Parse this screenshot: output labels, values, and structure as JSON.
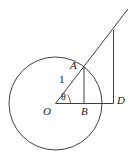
{
  "figure": {
    "kind": "geometry-diagram",
    "background_color": "#ffffff",
    "stroke_color": "#2b2b2b",
    "labels": {
      "point_A": "A",
      "point_O": "O",
      "point_B": "B",
      "point_D": "D",
      "radius_length": "1",
      "angle": "θ"
    },
    "points": {
      "O": {
        "x": 55.5,
        "y": 103.5,
        "name": "center"
      },
      "A": {
        "x": 84.0,
        "y": 67.0,
        "name": "point-on-circle"
      },
      "B": {
        "x": 84.0,
        "y": 103.5,
        "name": "foot-of-perpendicular"
      },
      "D": {
        "x": 113.5,
        "y": 103.5,
        "name": "point-on-axis"
      },
      "T": {
        "x": 113.5,
        "y": 30.0,
        "name": "top-of-vertical-segment"
      },
      "ray_end": {
        "x": 128.0,
        "y": 9.0,
        "name": "ray-terminus"
      }
    },
    "circle": {
      "cx": 55.5,
      "cy": 103.5,
      "r": 46.5,
      "radius_label": "1"
    },
    "segments": [
      {
        "name": "radius-OA-extended-ray",
        "from": "O",
        "to": "ray_end",
        "label": "1"
      },
      {
        "name": "horizontal-axis-OD",
        "from": "O",
        "to": "D"
      },
      {
        "name": "perpendicular-AB",
        "from": "A",
        "to": "B"
      },
      {
        "name": "vertical-DT",
        "from": "D",
        "to": "T"
      }
    ],
    "angle_mark": {
      "at": "O",
      "label": "θ",
      "between": [
        "horizontal-axis-OD",
        "radius-OA-extended-ray"
      ]
    }
  }
}
